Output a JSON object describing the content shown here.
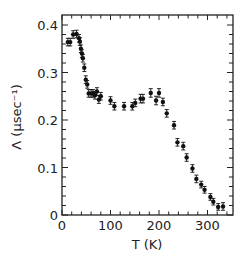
{
  "chart_data": {
    "type": "scatter",
    "title": "",
    "xlabel": "T (K)",
    "ylabel": "Λ (μsec⁻¹)",
    "xlim": [
      0,
      350
    ],
    "ylim": [
      0,
      0.42
    ],
    "x_ticks": [
      0,
      100,
      200,
      300
    ],
    "x_tick_labels": [
      "0",
      "100",
      "200",
      "300"
    ],
    "x_minor_step": 20,
    "y_ticks": [
      0,
      0.1,
      0.2,
      0.3,
      0.4
    ],
    "y_tick_labels": [
      "0",
      "0.1",
      "0.2",
      "0.3",
      "0.4"
    ],
    "y_minor_step": 0.02,
    "grid": false,
    "legend": null,
    "error_bars": true,
    "series": [
      {
        "name": "Λ vs T",
        "marker": "filled-circle",
        "color": "#111111",
        "points": [
          {
            "x": 12,
            "y": 0.364,
            "err": 0.008
          },
          {
            "x": 17,
            "y": 0.364,
            "err": 0.008
          },
          {
            "x": 23,
            "y": 0.38,
            "err": 0.008
          },
          {
            "x": 30,
            "y": 0.381,
            "err": 0.008
          },
          {
            "x": 35,
            "y": 0.372,
            "err": 0.008
          },
          {
            "x": 37,
            "y": 0.365,
            "err": 0.008
          },
          {
            "x": 39,
            "y": 0.35,
            "err": 0.008
          },
          {
            "x": 41,
            "y": 0.34,
            "err": 0.008
          },
          {
            "x": 43,
            "y": 0.33,
            "err": 0.008
          },
          {
            "x": 46,
            "y": 0.31,
            "err": 0.008
          },
          {
            "x": 49,
            "y": 0.285,
            "err": 0.008
          },
          {
            "x": 52,
            "y": 0.275,
            "err": 0.008
          },
          {
            "x": 55,
            "y": 0.256,
            "err": 0.008
          },
          {
            "x": 60,
            "y": 0.256,
            "err": 0.008
          },
          {
            "x": 64,
            "y": 0.256,
            "err": 0.008
          },
          {
            "x": 68,
            "y": 0.252,
            "err": 0.008
          },
          {
            "x": 72,
            "y": 0.26,
            "err": 0.008
          },
          {
            "x": 76,
            "y": 0.243,
            "err": 0.008
          },
          {
            "x": 80,
            "y": 0.25,
            "err": 0.008
          },
          {
            "x": 100,
            "y": 0.241,
            "err": 0.008
          },
          {
            "x": 108,
            "y": 0.229,
            "err": 0.008
          },
          {
            "x": 128,
            "y": 0.229,
            "err": 0.008
          },
          {
            "x": 145,
            "y": 0.229,
            "err": 0.008
          },
          {
            "x": 151,
            "y": 0.236,
            "err": 0.008
          },
          {
            "x": 162,
            "y": 0.245,
            "err": 0.009
          },
          {
            "x": 167,
            "y": 0.245,
            "err": 0.009
          },
          {
            "x": 183,
            "y": 0.257,
            "err": 0.009
          },
          {
            "x": 194,
            "y": 0.241,
            "err": 0.009
          },
          {
            "x": 200,
            "y": 0.257,
            "err": 0.009
          },
          {
            "x": 208,
            "y": 0.238,
            "err": 0.008
          },
          {
            "x": 216,
            "y": 0.214,
            "err": 0.008
          },
          {
            "x": 231,
            "y": 0.189,
            "err": 0.008
          },
          {
            "x": 238,
            "y": 0.153,
            "err": 0.008
          },
          {
            "x": 250,
            "y": 0.145,
            "err": 0.008
          },
          {
            "x": 257,
            "y": 0.121,
            "err": 0.008
          },
          {
            "x": 269,
            "y": 0.098,
            "err": 0.008
          },
          {
            "x": 277,
            "y": 0.076,
            "err": 0.008
          },
          {
            "x": 287,
            "y": 0.064,
            "err": 0.007
          },
          {
            "x": 294,
            "y": 0.053,
            "err": 0.007
          },
          {
            "x": 306,
            "y": 0.038,
            "err": 0.007
          },
          {
            "x": 312,
            "y": 0.028,
            "err": 0.007
          },
          {
            "x": 322,
            "y": 0.017,
            "err": 0.007
          },
          {
            "x": 332,
            "y": 0.018,
            "err": 0.008
          }
        ]
      }
    ]
  },
  "layout": {
    "plot_left": 62,
    "plot_right": 233,
    "plot_top": 15,
    "plot_bottom": 215,
    "x_px_per_unit": 0.485,
    "y_px_per_unit": 475
  }
}
